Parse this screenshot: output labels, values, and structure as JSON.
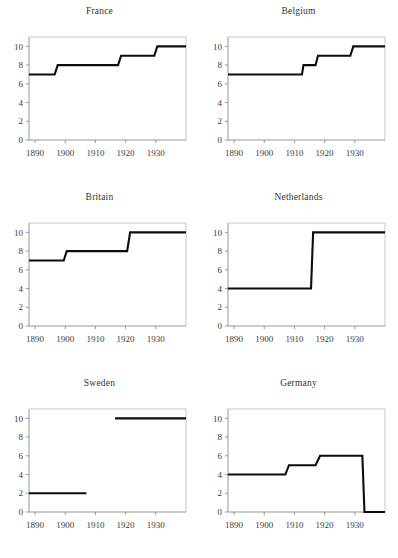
{
  "figure": {
    "background": "#ffffff",
    "line_color": "#0d0d0d",
    "axis_color": "#8c8c8c",
    "frame_color": "#b8b8b8",
    "panel_count": 6,
    "layout": "2 columns x 3 rows"
  },
  "panels": [
    {
      "key": "france",
      "title": "France"
    },
    {
      "key": "belgium",
      "title": "Belgium"
    },
    {
      "key": "britain",
      "title": "Britain"
    },
    {
      "key": "netherlands",
      "title": "Netherlands"
    },
    {
      "key": "sweden",
      "title": "Sweden"
    },
    {
      "key": "germany",
      "title": "Germany"
    }
  ],
  "axes": {
    "x_ticks": [
      1890,
      1900,
      1910,
      1920,
      1930
    ],
    "x_tick_labels": [
      "1890",
      "1900",
      "1910",
      "1920",
      "1930"
    ],
    "y_ticks": [
      0,
      2,
      4,
      6,
      8,
      10
    ],
    "y_tick_labels": [
      "0",
      "2",
      "4",
      "6",
      "8",
      "10"
    ],
    "xlim": [
      1888,
      1940
    ],
    "ylim": [
      0,
      11
    ],
    "grid": false,
    "legend": "none"
  },
  "chart_data": [
    {
      "type": "line",
      "title": "France",
      "xlabel": "",
      "ylabel": "",
      "xlim": [
        1888,
        1940
      ],
      "ylim": [
        0,
        11
      ],
      "x_ticks": [
        1890,
        1900,
        1910,
        1920,
        1930
      ],
      "y_ticks": [
        0,
        2,
        4,
        6,
        8,
        10
      ],
      "grid": false,
      "step": true,
      "segments": [
        {
          "x": [
            1888,
            1896.5
          ],
          "y": [
            7,
            7
          ]
        },
        {
          "x": [
            1897.5,
            1917.5
          ],
          "y": [
            8,
            8
          ]
        },
        {
          "x": [
            1918.5,
            1929.5
          ],
          "y": [
            9,
            9
          ]
        },
        {
          "x": [
            1930.5,
            1940
          ],
          "y": [
            10,
            10
          ]
        }
      ],
      "points": [
        [
          1888,
          7
        ],
        [
          1896.5,
          7
        ],
        [
          1897.5,
          8
        ],
        [
          1917.5,
          8
        ],
        [
          1918.5,
          9
        ],
        [
          1929.5,
          9
        ],
        [
          1930.5,
          10
        ],
        [
          1940,
          10
        ]
      ]
    },
    {
      "type": "line",
      "title": "Belgium",
      "xlabel": "",
      "ylabel": "",
      "xlim": [
        1888,
        1940
      ],
      "ylim": [
        0,
        11
      ],
      "x_ticks": [
        1890,
        1900,
        1910,
        1920,
        1930
      ],
      "y_ticks": [
        0,
        2,
        4,
        6,
        8,
        10
      ],
      "grid": false,
      "step": true,
      "gaps": true,
      "segments": [
        {
          "x": [
            1888,
            1912.5
          ],
          "y": [
            7,
            7
          ]
        },
        {
          "x": [
            1913.0,
            1914.5
          ],
          "y": [
            8,
            8
          ],
          "break_before": true
        },
        {
          "x": [
            1915.5,
            1917.0
          ],
          "y": [
            8,
            8
          ]
        },
        {
          "x": [
            1917.8,
            1928.5
          ],
          "y": [
            9,
            9
          ]
        },
        {
          "x": [
            1929.5,
            1940
          ],
          "y": [
            10,
            10
          ]
        }
      ]
    },
    {
      "type": "line",
      "title": "Britain",
      "xlabel": "",
      "ylabel": "",
      "xlim": [
        1888,
        1940
      ],
      "ylim": [
        0,
        11
      ],
      "x_ticks": [
        1890,
        1900,
        1910,
        1920,
        1930
      ],
      "y_ticks": [
        0,
        2,
        4,
        6,
        8,
        10
      ],
      "grid": false,
      "step": true,
      "segments": [
        {
          "x": [
            1888,
            1899.5
          ],
          "y": [
            7,
            7
          ]
        },
        {
          "x": [
            1900.5,
            1920.5
          ],
          "y": [
            8,
            8
          ]
        },
        {
          "x": [
            1921.5,
            1940
          ],
          "y": [
            10,
            10
          ]
        }
      ]
    },
    {
      "type": "line",
      "title": "Netherlands",
      "xlabel": "",
      "ylabel": "",
      "xlim": [
        1888,
        1940
      ],
      "ylim": [
        0,
        11
      ],
      "x_ticks": [
        1890,
        1900,
        1910,
        1920,
        1930
      ],
      "y_ticks": [
        0,
        2,
        4,
        6,
        8,
        10
      ],
      "grid": false,
      "step": true,
      "segments": [
        {
          "x": [
            1888,
            1915.5
          ],
          "y": [
            4,
            4
          ]
        },
        {
          "x": [
            1916.2,
            1940
          ],
          "y": [
            10,
            10
          ]
        }
      ]
    },
    {
      "type": "line",
      "title": "Sweden",
      "xlabel": "",
      "ylabel": "",
      "xlim": [
        1888,
        1940
      ],
      "ylim": [
        0,
        11
      ],
      "x_ticks": [
        1890,
        1900,
        1910,
        1920,
        1930
      ],
      "y_ticks": [
        0,
        2,
        4,
        6,
        8,
        10
      ],
      "grid": false,
      "step": true,
      "gaps": true,
      "segments": [
        {
          "x": [
            1888,
            1907.0
          ],
          "y": [
            2,
            2
          ]
        },
        {
          "x": [
            1916.5,
            1940
          ],
          "y": [
            10,
            10
          ]
        }
      ]
    },
    {
      "type": "line",
      "title": "Germany",
      "xlabel": "",
      "ylabel": "",
      "xlim": [
        1888,
        1940
      ],
      "ylim": [
        0,
        11
      ],
      "x_ticks": [
        1890,
        1900,
        1910,
        1920,
        1930
      ],
      "y_ticks": [
        0,
        2,
        4,
        6,
        8,
        10
      ],
      "grid": false,
      "step": true,
      "gaps": true,
      "segments": [
        {
          "x": [
            1888,
            1907.0
          ],
          "y": [
            4,
            4
          ]
        },
        {
          "x": [
            1908.2,
            1917.0
          ],
          "y": [
            5,
            5
          ]
        },
        {
          "x": [
            1918.5,
            1932.5
          ],
          "y": [
            6,
            6
          ]
        },
        {
          "x": [
            1933.2,
            1940
          ],
          "y": [
            0,
            0
          ]
        }
      ]
    }
  ]
}
